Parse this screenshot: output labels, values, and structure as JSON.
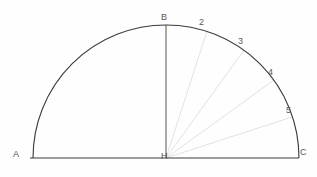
{
  "figure": {
    "name": "semicircle-with-angle-divisions",
    "background_color": "#fefefe",
    "arc_color": "#3a3a3a",
    "baseline_color": "#3a3a3a",
    "radius_color": "#555555",
    "ray_color": "#e2e2e2",
    "label_color": "#555555",
    "geometry": {
      "center_x": 166,
      "center_y": 158,
      "radius": 133,
      "arc_start_deg": 0,
      "arc_end_deg": 180
    },
    "vertices": [
      {
        "id": "A",
        "label": "A",
        "x": 30,
        "y": 158,
        "label_x": 13,
        "label_y": 150
      },
      {
        "id": "B",
        "label": "B",
        "x": 166,
        "y": 25,
        "label_x": 161,
        "label_y": 13
      },
      {
        "id": "C",
        "label": "C",
        "x": 299,
        "y": 158,
        "label_x": 300,
        "label_y": 148
      },
      {
        "id": "H",
        "label": "H",
        "x": 166,
        "y": 158,
        "label_x": 161,
        "label_y": 152
      }
    ],
    "rays": [
      {
        "label": "2",
        "angle_deg": 72,
        "end_x": 207,
        "end_y": 31,
        "label_x": 199,
        "label_y": 18
      },
      {
        "label": "3",
        "angle_deg": 54,
        "end_x": 244,
        "end_y": 50,
        "label_x": 238,
        "label_y": 37
      },
      {
        "label": "4",
        "angle_deg": 36,
        "end_x": 274,
        "end_y": 80,
        "label_x": 268,
        "label_y": 68
      },
      {
        "label": "5",
        "angle_deg": 18,
        "end_x": 292,
        "end_y": 117,
        "label_x": 286,
        "label_y": 106
      }
    ],
    "sector_count": 5,
    "sector_angle_deg": 18
  }
}
